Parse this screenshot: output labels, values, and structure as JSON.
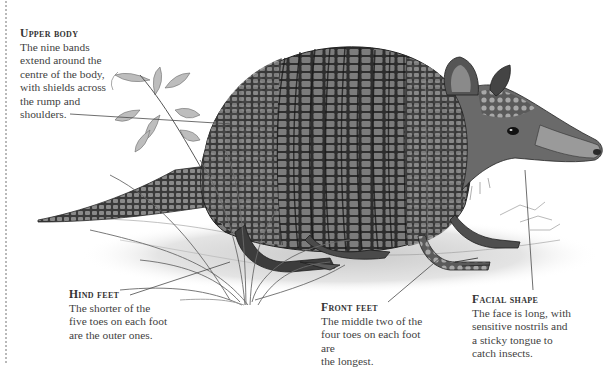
{
  "illustration": {
    "subject": "Nine-banded armadillo",
    "style": "monochrome engraving"
  },
  "captions": [
    {
      "id": "upper-body",
      "heading": "Upper body",
      "body": "The nine bands\nextend around the\ncentre of the body,\nwith shields across\nthe rump and\nshoulders."
    },
    {
      "id": "hind-feet",
      "heading": "Hind feet",
      "body": "The shorter of the\nfive toes on each foot\nare the outer ones."
    },
    {
      "id": "front-feet",
      "heading": "Front feet",
      "body": "The middle two of the\nfour toes on each foot are\nthe longest."
    },
    {
      "id": "facial-shape",
      "heading": "Facial shape",
      "body": "The face is long, with\nsensitive nostrils and\na sticky tongue to\ncatch insects."
    }
  ],
  "colors": {
    "background": "#ffffff",
    "text": "#3f3f3f",
    "ink_dark": "#2a2a2a",
    "ink_mid": "#6b6b6b",
    "ink_light": "#b5b5b5",
    "leader_line": "#555555"
  }
}
